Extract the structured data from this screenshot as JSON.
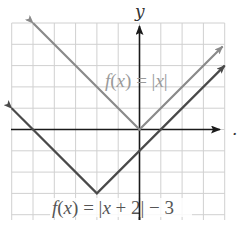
{
  "chart_data": {
    "type": "line",
    "title": "",
    "xlabel": "x",
    "ylabel": "y",
    "xlim": [
      -6,
      4
    ],
    "ylim": [
      -4,
      5
    ],
    "grid": true,
    "legend": "inline labels",
    "series": [
      {
        "name": "f(x) = |x|",
        "color": "#8a8a8a",
        "points": [
          [
            -5,
            5
          ],
          [
            0,
            0
          ],
          [
            3.9,
            3.9
          ]
        ]
      },
      {
        "name": "f(x) = |x + 2| − 3",
        "color": "#4a4a4a",
        "points": [
          [
            -6,
            1
          ],
          [
            -2,
            -3
          ],
          [
            4,
            3
          ]
        ]
      }
    ],
    "annotations": [
      {
        "text": "f(x) = |x|",
        "position": [
          -0.5,
          2.3
        ]
      },
      {
        "text": "f(x) = |x + 2| − 3",
        "position": [
          -2.5,
          -3.7
        ]
      }
    ]
  },
  "labels": {
    "y_axis": "y",
    "trailing_mark": ".",
    "f1": {
      "f": "f",
      "open": "(",
      "x": "x",
      "close": ")",
      "eq": " = |",
      "x2": "x",
      "bar": "|"
    },
    "f2": {
      "f": "f",
      "open": "(",
      "x": "x",
      "close": ")",
      "eq": " = |",
      "x2": "x",
      "rest": " + 2| − 3"
    }
  },
  "colors": {
    "grid": "#d0d0d0",
    "axis": "#1a1a1a",
    "abs_x": "#8a8a8a",
    "shifted": "#4a4a4a",
    "label_abs": "#9a9a9a",
    "label_shifted": "#555555"
  }
}
